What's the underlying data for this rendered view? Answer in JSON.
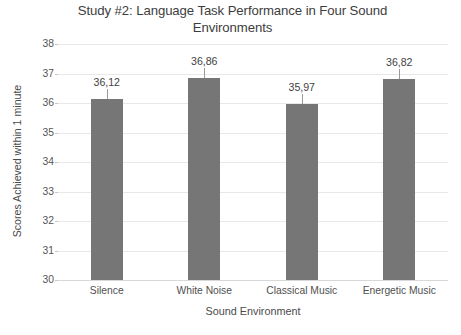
{
  "chart_data": {
    "type": "bar",
    "title": "Study #2: Language Task Performance in Four Sound Environments",
    "title_line1": "Study #2: Language Task Performance in Four Sound",
    "title_line2": "Environments",
    "xlabel": "Sound Environment",
    "ylabel": "Scores Achieved within 1 minute",
    "categories": [
      "Silence",
      "White Noise",
      "Classical Music",
      "Energetic Music"
    ],
    "values": [
      36.12,
      36.86,
      35.97,
      36.82
    ],
    "value_labels": [
      "36,12",
      "36,86",
      "35,97",
      "36,82"
    ],
    "ylim": [
      30,
      38
    ],
    "ytick_step": 1,
    "ytick_labels": [
      "38",
      "37",
      "36",
      "35",
      "34",
      "33",
      "32",
      "31",
      "30"
    ],
    "grid": true,
    "grid_axis": "y",
    "legend": false,
    "bar_color": "#767676",
    "gridline_color": "#e8e8e8",
    "text_color": "#4a4a4a"
  }
}
